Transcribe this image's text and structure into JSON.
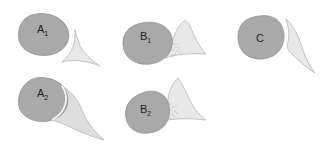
{
  "figure": {
    "panels": [
      {
        "id": "A1",
        "letter": "A",
        "subscript": "1",
        "relation": "separated, no contact"
      },
      {
        "id": "B1",
        "letter": "B",
        "subscript": "1",
        "relation": "contact with stippled zone"
      },
      {
        "id": "C",
        "letter": "C",
        "subscript": "",
        "relation": "separated, parallel surfaces"
      },
      {
        "id": "A2",
        "letter": "A",
        "subscript": "2",
        "relation": "wrapped contact"
      },
      {
        "id": "B2",
        "letter": "B",
        "subscript": "2",
        "relation": "contact with stippled zone"
      }
    ],
    "colors": {
      "body_fill": "#a9a9a9",
      "body_stroke": "#8c8c8c",
      "wedge_fill": "#e6e6e6",
      "wedge_stroke": "#b8b8b8",
      "stipple": "#9a9a9a",
      "label": "#1e1e1e"
    }
  }
}
